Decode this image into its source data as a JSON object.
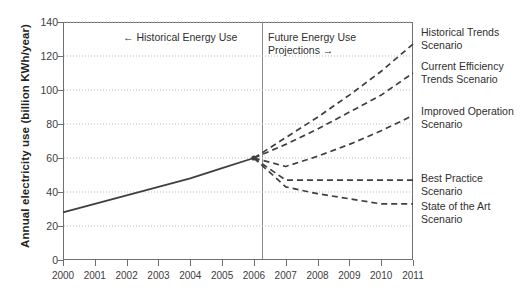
{
  "chart_data": {
    "type": "line",
    "title": "",
    "xlabel": "",
    "ylabel": "Annual electricity use (billion KWh/year)",
    "ylim": [
      0,
      140
    ],
    "yticks": [
      0,
      20,
      40,
      60,
      80,
      100,
      120,
      140
    ],
    "grid": true,
    "legend_position": "right-of-plot",
    "x": [
      2000,
      2001,
      2002,
      2003,
      2004,
      2005,
      2006,
      2007,
      2008,
      2009,
      2010,
      2011
    ],
    "xticklabels": [
      "2000",
      "2001",
      "2002",
      "2003",
      "2004",
      "2005",
      "2006",
      "2007",
      "2008",
      "2009",
      "2010",
      "2011"
    ],
    "divider_x": 2006,
    "annotations": [
      {
        "name": "historical-region-note",
        "text": "← Historical Energy Use",
        "x": 2003,
        "y": 132
      },
      {
        "name": "future-region-note",
        "text": "Future Energy Use Projections →",
        "x": 2007,
        "y": 132
      }
    ],
    "series": [
      {
        "name": "Historical Energy Use",
        "style": "solid",
        "x": [
          2000,
          2001,
          2002,
          2003,
          2004,
          2005,
          2006
        ],
        "values": [
          28,
          33,
          38,
          43,
          48,
          54,
          60
        ]
      },
      {
        "name": "Historical Trends Scenario",
        "style": "dashed",
        "x": [
          2006,
          2007,
          2008,
          2009,
          2010,
          2011
        ],
        "values": [
          60,
          72,
          84,
          97,
          111,
          127
        ]
      },
      {
        "name": "Current Efficiency Trends Scenario",
        "style": "dashed",
        "x": [
          2006,
          2007,
          2008,
          2009,
          2010,
          2011
        ],
        "values": [
          60,
          68,
          77,
          87,
          97,
          110
        ]
      },
      {
        "name": "Improved Operation Scenario",
        "style": "dashed",
        "x": [
          2006,
          2007,
          2008,
          2009,
          2010,
          2011
        ],
        "values": [
          60,
          55,
          61,
          68,
          76,
          85
        ]
      },
      {
        "name": "Best Practice Scenario",
        "style": "dashed",
        "x": [
          2006,
          2007,
          2008,
          2009,
          2010,
          2011
        ],
        "values": [
          60,
          47,
          47,
          47,
          47,
          47
        ]
      },
      {
        "name": "State of the Art Scenario",
        "style": "dashed",
        "x": [
          2006,
          2007,
          2008,
          2009,
          2010,
          2011
        ],
        "values": [
          60,
          43,
          39,
          36,
          33,
          33
        ]
      }
    ],
    "series_labels": [
      {
        "line1": "Historical Trends",
        "line2": "Scenario"
      },
      {
        "line1": "Current Efficiency",
        "line2": "Trends Scenario"
      },
      {
        "line1": "Improved Operation",
        "line2": "Scenario"
      },
      {
        "line1": "Best Practice",
        "line2": "Scenario"
      },
      {
        "line1": "State of the Art",
        "line2": "Scenario"
      }
    ],
    "colors": {
      "line": "#3f3f3f",
      "axis": "#6f6f6f",
      "grid": "#bdbdbd",
      "background": "#ffffff",
      "text": "#2f2f2f"
    }
  }
}
